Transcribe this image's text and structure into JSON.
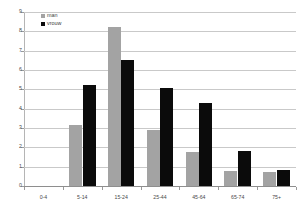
{
  "chart_data": {
    "type": "bar",
    "title": "",
    "xlabel": "",
    "ylabel": "",
    "ylim": [
      0,
      9
    ],
    "yticks": [
      0,
      1,
      2,
      3,
      4,
      5,
      6,
      7,
      8,
      9
    ],
    "ytick_labels": [
      "0",
      "1",
      "2",
      "3",
      "4",
      "5",
      "6",
      "7",
      "8",
      "9"
    ],
    "grid": true,
    "legend_position": "top-left",
    "categories": [
      "0-4",
      "5-14",
      "15-24",
      "25-44",
      "45-64",
      "65-74",
      "75+"
    ],
    "series": [
      {
        "name": "man",
        "color": "#a3a3a3",
        "values": [
          0,
          3.15,
          8.25,
          2.9,
          1.75,
          0.8,
          0.7
        ]
      },
      {
        "name": "vrouw",
        "color": "#0b0b0b",
        "values": [
          0,
          5.25,
          6.5,
          5.05,
          4.3,
          1.8,
          0.85
        ]
      }
    ]
  },
  "legend": {
    "items": [
      {
        "label": "man",
        "swatch": "man"
      },
      {
        "label": "vrouw",
        "swatch": "vrouw"
      }
    ]
  },
  "colors": {
    "man": "#a3a3a3",
    "vrouw": "#0b0b0b",
    "gridline": "#c9c9c9",
    "axis": "#8e8e8e",
    "text": "#4a4a4a",
    "background": "#ffffff"
  }
}
